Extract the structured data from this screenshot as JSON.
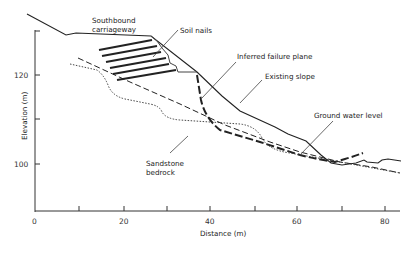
{
  "diagram": {
    "type": "cross-section",
    "axes": {
      "x_label": "Distance (m)",
      "y_label": "Elevation (m)",
      "x_ticks": [
        "0",
        "20",
        "40",
        "60",
        "80"
      ],
      "y_ticks": [
        "120",
        "100"
      ]
    },
    "labels": {
      "southbound_line1": "Southbound",
      "southbound_line2": "carriageway",
      "soil_nails": "Soil nails",
      "failure_plane": "Inferred failure plane",
      "existing_slope": "Existing slope",
      "ground_water": "Ground water level",
      "bedrock_line1": "Sandstone",
      "bedrock_line2": "bedrock"
    },
    "colors": {
      "line": "#222222",
      "background": "#ffffff"
    }
  }
}
